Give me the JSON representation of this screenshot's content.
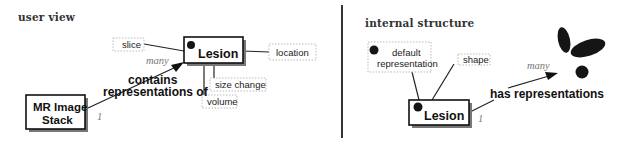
{
  "user_view": {
    "title": "user view",
    "entities": {
      "lesion": "Lesion",
      "mr_stack_line1": "MR Image",
      "mr_stack_line2": "Stack"
    },
    "attributes": {
      "slice": "slice",
      "location": "location",
      "size_change": "size change",
      "volume": "volume"
    },
    "relationship": {
      "line1": "contains",
      "line2": "representations of"
    },
    "cardinality": {
      "many": "many",
      "one": "1"
    }
  },
  "internal_structure": {
    "title": "internal structure",
    "entities": {
      "lesion": "Lesion"
    },
    "attributes": {
      "default_line1": "default",
      "default_line2": "representation",
      "shape": "shape"
    },
    "relationship": {
      "label": "has representations"
    },
    "cardinality": {
      "many": "many",
      "one": "1"
    }
  }
}
